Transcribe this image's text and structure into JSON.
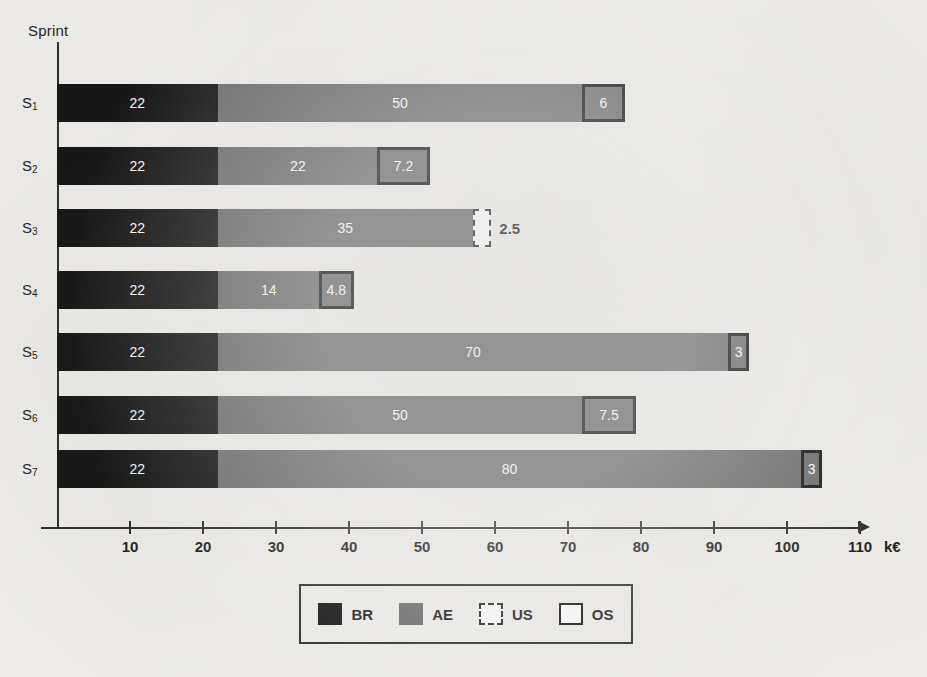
{
  "chart_data": {
    "type": "bar",
    "orientation": "horizontal",
    "stacked": true,
    "title": "",
    "xlabel": "k€",
    "ylabel": "Sprint",
    "xlim": [
      0,
      110
    ],
    "grid": false,
    "legend_position": "bottom",
    "categories": [
      "S1",
      "S2",
      "S3",
      "S4",
      "S5",
      "S6",
      "S7"
    ],
    "category_labels": [
      "S",
      "S",
      "S",
      "S",
      "S",
      "S",
      "S"
    ],
    "category_subscripts": [
      "1",
      "2",
      "3",
      "4",
      "5",
      "6",
      "7"
    ],
    "xticks": [
      10,
      20,
      30,
      40,
      50,
      60,
      70,
      80,
      90,
      100,
      110
    ],
    "series": [
      {
        "name": "BR",
        "values": [
          22,
          22,
          22,
          22,
          22,
          22,
          22
        ]
      },
      {
        "name": "AE",
        "values": [
          50,
          22,
          35,
          14,
          70,
          50,
          80
        ]
      },
      {
        "name": "US",
        "values": [
          0,
          0,
          2.5,
          0,
          0,
          0,
          0
        ]
      },
      {
        "name": "OS",
        "values": [
          6,
          7.2,
          0,
          4.8,
          3,
          7.5,
          3
        ]
      }
    ],
    "rows": [
      {
        "category": "S1",
        "sub": "1",
        "segments": [
          {
            "series": "BR",
            "value": 22,
            "label": "22",
            "kind": "br",
            "label_inside": true
          },
          {
            "series": "AE",
            "value": 50,
            "label": "50",
            "kind": "ae",
            "label_inside": true
          },
          {
            "series": "OS",
            "value": 6,
            "label": "6",
            "kind": "os",
            "label_inside": true
          }
        ]
      },
      {
        "category": "S2",
        "sub": "2",
        "segments": [
          {
            "series": "BR",
            "value": 22,
            "label": "22",
            "kind": "br",
            "label_inside": true
          },
          {
            "series": "AE",
            "value": 22,
            "label": "22",
            "kind": "ae",
            "label_inside": true
          },
          {
            "series": "OS",
            "value": 7.2,
            "label": "7.2",
            "kind": "os",
            "label_inside": true
          }
        ]
      },
      {
        "category": "S3",
        "sub": "3",
        "segments": [
          {
            "series": "BR",
            "value": 22,
            "label": "22",
            "kind": "br",
            "label_inside": true
          },
          {
            "series": "AE",
            "value": 35,
            "label": "35",
            "kind": "ae",
            "label_inside": true
          },
          {
            "series": "US",
            "value": 2.5,
            "label": "2.5",
            "kind": "us",
            "label_inside": false
          }
        ]
      },
      {
        "category": "S4",
        "sub": "4",
        "segments": [
          {
            "series": "BR",
            "value": 22,
            "label": "22",
            "kind": "br",
            "label_inside": true
          },
          {
            "series": "AE",
            "value": 14,
            "label": "14",
            "kind": "ae",
            "label_inside": true
          },
          {
            "series": "OS",
            "value": 4.8,
            "label": "4.8",
            "kind": "os",
            "label_inside": true
          }
        ]
      },
      {
        "category": "S5",
        "sub": "5",
        "segments": [
          {
            "series": "BR",
            "value": 22,
            "label": "22",
            "kind": "br",
            "label_inside": true
          },
          {
            "series": "AE",
            "value": 70,
            "label": "70",
            "kind": "ae",
            "label_inside": true
          },
          {
            "series": "OS",
            "value": 3,
            "label": "3",
            "kind": "os",
            "label_inside": true
          }
        ]
      },
      {
        "category": "S6",
        "sub": "6",
        "segments": [
          {
            "series": "BR",
            "value": 22,
            "label": "22",
            "kind": "br",
            "label_inside": true
          },
          {
            "series": "AE",
            "value": 50,
            "label": "50",
            "kind": "ae",
            "label_inside": true
          },
          {
            "series": "OS",
            "value": 7.5,
            "label": "7.5",
            "kind": "os",
            "label_inside": true
          }
        ]
      },
      {
        "category": "S7",
        "sub": "7",
        "segments": [
          {
            "series": "BR",
            "value": 22,
            "label": "22",
            "kind": "br",
            "label_inside": true
          },
          {
            "series": "AE",
            "value": 80,
            "label": "80",
            "kind": "ae",
            "label_inside": true
          },
          {
            "series": "OS",
            "value": 3,
            "label": "3",
            "kind": "os",
            "label_inside": true
          }
        ]
      }
    ],
    "legend": [
      {
        "label": "BR",
        "kind": "br"
      },
      {
        "label": "AE",
        "kind": "ae"
      },
      {
        "label": "US",
        "kind": "us"
      },
      {
        "label": "OS",
        "kind": "os"
      }
    ],
    "colors": {
      "br": "#111111",
      "ae": "#6b6b6b",
      "us_fill": "#ffffff",
      "os_fill": "#6b6b6b",
      "axis": "#2b2b2b",
      "text": "#1a1a1a",
      "background": "#f2f0ec"
    }
  },
  "geometry": {
    "origin_x": 57,
    "px_per_unit": 7.3,
    "row_tops": [
      84,
      147,
      209,
      271,
      333,
      396,
      450
    ],
    "bar_height": 38
  }
}
